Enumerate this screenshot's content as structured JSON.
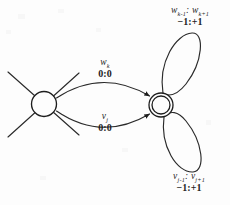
{
  "diagram": {
    "type": "finite-state-automaton",
    "ink_color": "#1d1d1d",
    "background_color": "#fdfdfd",
    "states": [
      {
        "id": "left",
        "name": "start-state",
        "shape": "circle",
        "accepting": false,
        "cx": 44,
        "cy": 104,
        "r": 12.5
      },
      {
        "id": "right",
        "name": "accepting-state",
        "shape": "double-circle",
        "accepting": true,
        "cx": 161,
        "cy": 105,
        "r": 12
      }
    ],
    "transitions": [
      {
        "id": "upper",
        "from": "left",
        "to": "right",
        "symbol": "w",
        "symbol_sub": "k",
        "weight": "0:0"
      },
      {
        "id": "lower",
        "from": "left",
        "to": "right",
        "symbol": "v",
        "symbol_sub": "j",
        "weight": "0:0"
      }
    ],
    "self_loops": [
      {
        "id": "top-loop",
        "on": "right",
        "symbol_left": "w",
        "symbol_left_sub": "k-1",
        "symbol_right": "w",
        "symbol_right_sub": "k+1",
        "separator": ":",
        "weight": "−1:+1"
      },
      {
        "id": "bottom-loop",
        "on": "right",
        "symbol_left": "v",
        "symbol_left_sub": "j-1",
        "symbol_right": "v",
        "symbol_right_sub": "j+1",
        "separator": ":",
        "weight": "−1:+1"
      }
    ],
    "incoming_edges": [
      {
        "id": "from-upper-left",
        "to": "left"
      },
      {
        "id": "from-lower-left",
        "to": "left"
      }
    ]
  }
}
